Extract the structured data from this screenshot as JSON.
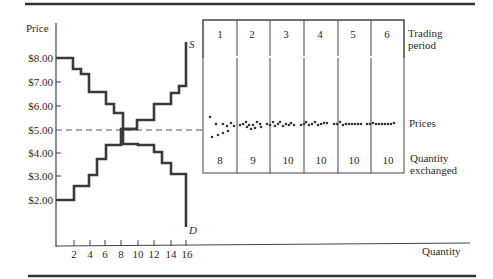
{
  "chart_data": [
    {
      "type": "line",
      "title": "",
      "xlabel": "Quantity",
      "ylabel": "Price",
      "x_ticks": [
        "2",
        "4",
        "6",
        "8",
        "10",
        "12",
        "14",
        "16"
      ],
      "y_ticks": [
        "$8.00",
        "$7.00",
        "$6.00",
        "$5.00",
        "$4.00",
        "$3.00",
        "$2.00"
      ],
      "xlim": [
        0,
        16
      ],
      "ylim": [
        0.6,
        9
      ],
      "grid": false,
      "reference_lines": [
        {
          "type": "horizontal",
          "y": 5.0,
          "style": "dashed"
        }
      ],
      "series": [
        {
          "name": "D",
          "label": "D",
          "step": true,
          "points": [
            [
              0,
              8.0
            ],
            [
              2,
              8.0
            ],
            [
              2,
              7.55
            ],
            [
              3,
              7.55
            ],
            [
              3,
              7.3
            ],
            [
              4,
              7.3
            ],
            [
              4,
              6.55
            ],
            [
              6,
              6.55
            ],
            [
              6,
              6.05
            ],
            [
              7,
              6.05
            ],
            [
              7,
              5.7
            ],
            [
              8,
              5.7
            ],
            [
              8,
              5.05
            ],
            [
              10,
              5.05
            ],
            [
              10,
              4.4
            ],
            [
              12,
              4.4
            ],
            [
              12,
              4.05
            ],
            [
              13,
              4.05
            ],
            [
              13,
              3.55
            ],
            [
              14,
              3.55
            ],
            [
              14,
              3.1
            ],
            [
              16,
              3.1
            ],
            [
              16,
              0.9
            ]
          ]
        },
        {
          "name": "S",
          "label": "S",
          "step": true,
          "points": [
            [
              0,
              2.0
            ],
            [
              2,
              2.0
            ],
            [
              2,
              2.6
            ],
            [
              4,
              2.6
            ],
            [
              4,
              3.1
            ],
            [
              5,
              3.1
            ],
            [
              5,
              3.75
            ],
            [
              6,
              3.75
            ],
            [
              6,
              4.4
            ],
            [
              8,
              4.4
            ],
            [
              8,
              5.05
            ],
            [
              10,
              5.05
            ],
            [
              10,
              5.4
            ],
            [
              12,
              5.4
            ],
            [
              12,
              6.05
            ],
            [
              14,
              6.05
            ],
            [
              14,
              6.55
            ],
            [
              15,
              6.55
            ],
            [
              15,
              6.8
            ],
            [
              16,
              6.8
            ],
            [
              16,
              8.6
            ]
          ]
        }
      ]
    },
    {
      "type": "table",
      "title": "",
      "row_labels": [
        "Trading period",
        "Prices",
        "Quantity exchanged"
      ],
      "periods": [
        "1",
        "2",
        "3",
        "4",
        "5",
        "6"
      ],
      "quantity_exchanged": [
        "8",
        "9",
        "10",
        "10",
        "10",
        "10"
      ],
      "prices_note": "Transaction prices per period cluster around $5.00, converging over time"
    }
  ],
  "labels": {
    "y_axis": "Price",
    "x_axis": "Quantity",
    "supply": "S",
    "demand": "D",
    "trading_period": [
      "Trading",
      "period"
    ],
    "prices": "Prices",
    "quantity_exchanged": [
      "Quantity",
      "exchanged"
    ]
  },
  "x_ticks": [
    "2",
    "4",
    "6",
    "8",
    "10",
    "12",
    "14",
    "16"
  ],
  "y_ticks": [
    "$8.00",
    "$7.00",
    "$6.00",
    "$5.00",
    "$4.00",
    "$3.00",
    "$2.00"
  ],
  "periods": [
    "1",
    "2",
    "3",
    "4",
    "5",
    "6"
  ],
  "quantities": [
    "8",
    "9",
    "10",
    "10",
    "10",
    "10"
  ],
  "price_dots": [
    [
      [
        210,
        117
      ],
      [
        212,
        137
      ],
      [
        216,
        124
      ],
      [
        218,
        135
      ],
      [
        223,
        124
      ],
      [
        223,
        133
      ],
      [
        227,
        126
      ],
      [
        228,
        131
      ],
      [
        231,
        123
      ],
      [
        234,
        126
      ]
    ],
    [
      [
        240,
        125
      ],
      [
        243,
        124
      ],
      [
        246,
        122
      ],
      [
        247,
        127
      ],
      [
        249,
        125
      ],
      [
        251,
        129
      ],
      [
        253,
        125
      ],
      [
        255,
        128
      ],
      [
        257,
        122
      ],
      [
        260,
        124
      ],
      [
        261,
        127
      ]
    ],
    [
      [
        267,
        124
      ],
      [
        270,
        125
      ],
      [
        273,
        122
      ],
      [
        275,
        126
      ],
      [
        278,
        124
      ],
      [
        280,
        122
      ],
      [
        283,
        126
      ],
      [
        286,
        124
      ],
      [
        289,
        125
      ],
      [
        291,
        123
      ],
      [
        294,
        125
      ]
    ],
    [
      [
        301,
        125
      ],
      [
        304,
        124
      ],
      [
        306,
        122
      ],
      [
        309,
        125
      ],
      [
        312,
        124
      ],
      [
        315,
        122
      ],
      [
        318,
        125
      ],
      [
        321,
        124
      ],
      [
        324,
        123
      ],
      [
        327,
        123
      ]
    ],
    [
      [
        334,
        124
      ],
      [
        337,
        124
      ],
      [
        340,
        122
      ],
      [
        343,
        125
      ],
      [
        346,
        124
      ],
      [
        349,
        124
      ],
      [
        352,
        124
      ],
      [
        355,
        124
      ],
      [
        358,
        124
      ],
      [
        361,
        124
      ]
    ],
    [
      [
        367,
        124
      ],
      [
        370,
        124
      ],
      [
        373,
        123
      ],
      [
        376,
        124
      ],
      [
        379,
        124
      ],
      [
        382,
        124
      ],
      [
        385,
        124
      ],
      [
        388,
        124
      ],
      [
        391,
        124
      ],
      [
        394,
        123
      ]
    ]
  ]
}
